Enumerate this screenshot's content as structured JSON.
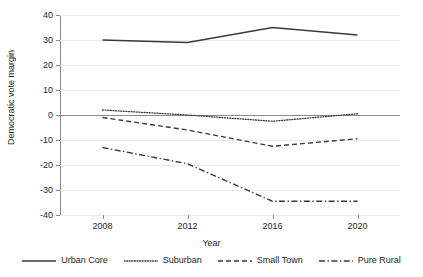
{
  "chart_data": {
    "type": "line",
    "title": "",
    "xlabel": "Year",
    "ylabel": "Democratic vote margin",
    "categories": [
      "2008",
      "2012",
      "2016",
      "2020"
    ],
    "x": [
      2008,
      2012,
      2016,
      2020
    ],
    "xlim": [
      2006,
      2022
    ],
    "ylim": [
      -40,
      40
    ],
    "ytick_labels": [
      "40",
      "30",
      "20",
      "10",
      "0",
      "-10",
      "-20",
      "-30",
      "-40"
    ],
    "yticks": [
      40,
      30,
      20,
      10,
      0,
      -10,
      -20,
      -30,
      -40
    ],
    "grid": true,
    "legend_position": "bottom",
    "series": [
      {
        "name": "Urban Core",
        "style": "solid",
        "color": "#3a3a3a",
        "values": [
          30,
          29,
          35,
          32
        ]
      },
      {
        "name": "Suburban",
        "style": "dotted",
        "color": "#3a3a3a",
        "values": [
          2,
          0,
          -2.5,
          0.5
        ]
      },
      {
        "name": "Small Town",
        "style": "dashed",
        "color": "#3a3a3a",
        "values": [
          -1,
          -6,
          -12.5,
          -9.5
        ]
      },
      {
        "name": "Pure Rural",
        "style": "dashdot",
        "color": "#3a3a3a",
        "values": [
          -13,
          -19.5,
          -34.5,
          -34.5
        ]
      }
    ]
  },
  "axis": {
    "x_title": "Year",
    "y_title": "Democratic vote margin"
  }
}
